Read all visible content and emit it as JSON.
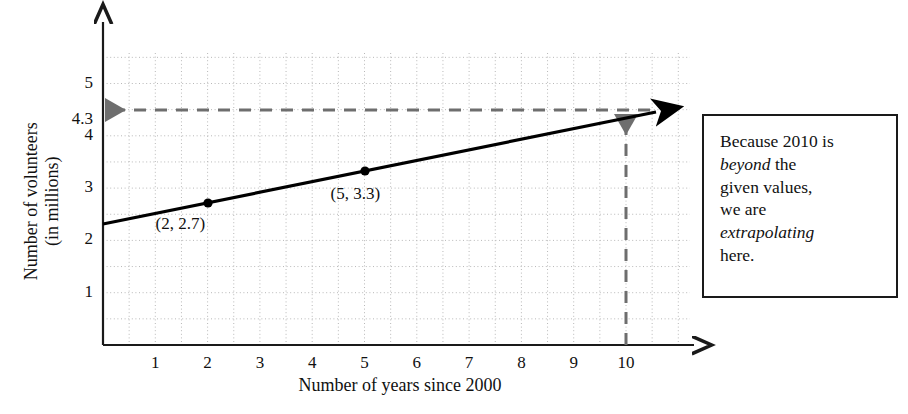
{
  "chart_data": {
    "type": "line",
    "title": "",
    "xlabel": "Number of years since 2000",
    "ylabel_lines": [
      "Number of volunteers",
      "(in millions)"
    ],
    "xlim": [
      0,
      11.4
    ],
    "ylim": [
      0,
      5.85
    ],
    "xticks": [
      1,
      2,
      3,
      4,
      5,
      6,
      7,
      8,
      9,
      10
    ],
    "xtick_labels": [
      "1",
      "2",
      "3",
      "4",
      "5",
      "6",
      "7",
      "8",
      "9",
      "10"
    ],
    "yticks": [
      1,
      2,
      3,
      4,
      5
    ],
    "ytick_labels": [
      "1",
      "2",
      "3",
      "4",
      "5"
    ],
    "extra_ytick": {
      "value": 4.3,
      "label": "4.3"
    },
    "grid": true,
    "grid_style": "dotted",
    "grid_step_x": 0.5,
    "grid_step_y": 0.5,
    "series": [
      {
        "name": "trend-line",
        "type": "line",
        "x": [
          0,
          10.7
        ],
        "y": [
          2.3,
          4.44
        ],
        "slope": 0.2,
        "intercept": 2.3,
        "arrow_end": true,
        "color": "#000000"
      }
    ],
    "points": [
      {
        "x": 2,
        "y": 2.7,
        "label": "(2, 2.7)",
        "label_dx": -22,
        "label_dy": 20
      },
      {
        "x": 5,
        "y": 3.3,
        "label": "(5, 3.3)",
        "label_dx": -4,
        "label_dy": 22
      }
    ],
    "annotations": [
      {
        "name": "horizontal-extrapolation-arrow",
        "type": "dashed-arrow",
        "from": {
          "x": 10.0,
          "y": 4.3
        },
        "to": {
          "x": 0.0,
          "y": 4.3
        },
        "color": "#6e6e6e"
      },
      {
        "name": "vertical-extrapolation-arrow",
        "type": "dashed-arrow",
        "from": {
          "x": 10.0,
          "y": 0.0
        },
        "to": {
          "x": 10.0,
          "y": 4.3
        },
        "color": "#6e6e6e"
      }
    ]
  },
  "callout": {
    "name": "extrapolation-note",
    "line1_a": "Because 2010 is",
    "line2_em": "beyond",
    "line2_b": " the",
    "line3": "given values,",
    "line4": "we are",
    "line5_em": "extrapolating",
    "line6": "here."
  },
  "colors": {
    "line": "#000000",
    "axis": "#1a1a1a",
    "grid": "#b8b8b8",
    "dashed": "#6e6e6e",
    "text": "#111111",
    "box_border": "#1a1a1a",
    "background": "#ffffff"
  }
}
